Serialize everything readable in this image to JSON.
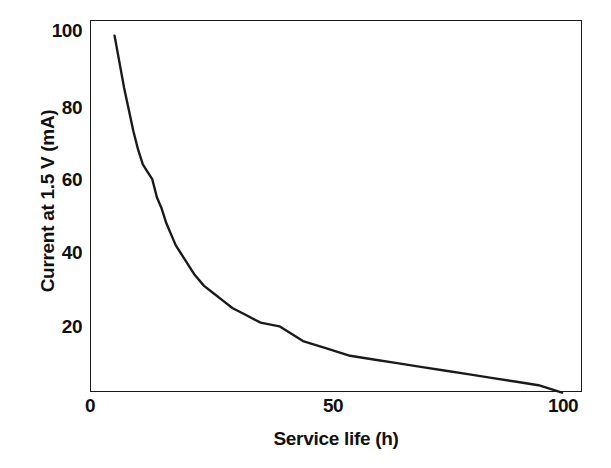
{
  "chart_data": {
    "type": "line",
    "title": "",
    "xlabel": "Service life (h)",
    "ylabel": "Current at 1.5 V (mA)",
    "xlim": [
      0,
      105
    ],
    "ylim": [
      0,
      102
    ],
    "xticks": [
      "0",
      "50",
      "100"
    ],
    "xtick_values": [
      0,
      50,
      100
    ],
    "yticks": [
      "20",
      "40",
      "60",
      "80",
      "100"
    ],
    "ytick_values": [
      20,
      40,
      60,
      80,
      100
    ],
    "grid": false,
    "legend": false,
    "line_color": "#1a1a1a",
    "background_color": "#ffffff",
    "series": [
      {
        "name": "Current at 1.5 V",
        "x": [
          5,
          6,
          7,
          8,
          9,
          10,
          11,
          12,
          13,
          14,
          15,
          16,
          17,
          18,
          19,
          20,
          22,
          24,
          26,
          28,
          30,
          33,
          36,
          40,
          45,
          50,
          55,
          60,
          65,
          70,
          75,
          80,
          85,
          90,
          95,
          100
        ],
        "values": [
          99,
          92,
          85,
          79,
          73,
          68,
          64,
          62,
          60,
          55,
          52,
          48,
          45,
          42,
          40,
          38,
          34,
          31,
          29,
          27,
          25,
          23,
          21,
          20,
          16,
          14,
          12,
          11,
          10,
          9,
          8,
          7,
          6,
          5,
          4,
          2
        ]
      }
    ]
  },
  "axes": {
    "x_title": "Service life (h)",
    "y_title": "Current at 1.5 V (mA)",
    "x_tick_labels": [
      "0",
      "50",
      "100"
    ],
    "y_tick_labels": [
      "100",
      "80",
      "60",
      "40",
      "20"
    ]
  }
}
